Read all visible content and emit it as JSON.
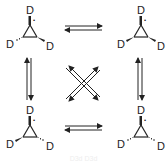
{
  "diagram": {
    "atom_label": "D",
    "radical_marker": "•",
    "molecules": [
      {
        "position": "top-left",
        "top": "D",
        "left": "D",
        "right": "D",
        "left_bond": "hashed",
        "right_bond": "wedge"
      },
      {
        "position": "top-right",
        "top": "D",
        "left": "D",
        "right": "D",
        "left_bond": "wedge",
        "right_bond": "wedge"
      },
      {
        "position": "bottom-left",
        "top": "D",
        "left": "D",
        "right": "D",
        "left_bond": "wedge",
        "right_bond": "hashed"
      },
      {
        "position": "bottom-right",
        "top": "D",
        "left": "D",
        "right": "D",
        "left_bond": "hashed",
        "right_bond": "hashed"
      }
    ],
    "arrows": [
      {
        "from": "top-left",
        "to": "top-right",
        "type": "equilibrium"
      },
      {
        "from": "bottom-left",
        "to": "bottom-right",
        "type": "equilibrium"
      },
      {
        "from": "top-left",
        "to": "bottom-left",
        "type": "equilibrium"
      },
      {
        "from": "top-right",
        "to": "bottom-right",
        "type": "equilibrium"
      },
      {
        "from": "top-left",
        "to": "bottom-right",
        "type": "equilibrium"
      },
      {
        "from": "top-right",
        "to": "bottom-left",
        "type": "equilibrium"
      }
    ],
    "footer": "D3d  D3d"
  }
}
